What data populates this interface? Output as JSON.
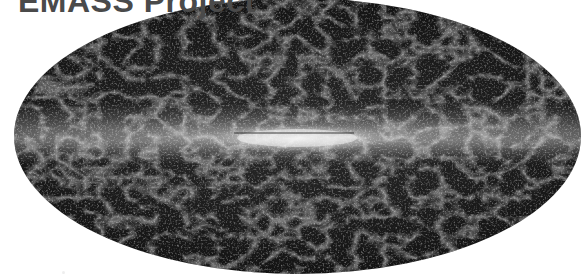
{
  "title": "EMASS Project",
  "image": {
    "description": "All-sky Mollweide-projection map of cosmic structure with a bright horizontal galactic plane band across the center",
    "projection": "mollweide-ellipse",
    "colors": {
      "background": "#ffffff",
      "sky_dark": "#141414",
      "band_bright": "#e8e8e8",
      "title_text": "#4a4a4a"
    }
  }
}
